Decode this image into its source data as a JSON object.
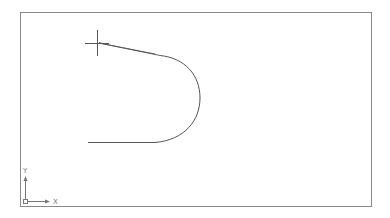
{
  "viewport": {
    "background": "#ffffff",
    "border_color": "#8a8a8a"
  },
  "drawing": {
    "stroke_color": "#555555",
    "entities": [
      {
        "type": "line",
        "name": "bottom-line",
        "from": [
          88,
          142
        ],
        "to": [
          155,
          142
        ]
      },
      {
        "type": "arc",
        "name": "semicircle-arc",
        "from": [
          155,
          142
        ],
        "to": [
          160,
          55
        ],
        "rightmost_x": 200
      },
      {
        "type": "polyline",
        "name": "tapered-sliver",
        "points": [
          [
            99,
            43
          ],
          [
            160,
            55
          ],
          [
            155,
            54
          ]
        ]
      }
    ]
  },
  "cursor": {
    "icon": "crosshair-icon",
    "position": [
      97,
      43
    ]
  },
  "ucs_icon": {
    "x_label": "X",
    "y_label": "Y",
    "origin_icon": "ucs-origin-square-icon"
  }
}
